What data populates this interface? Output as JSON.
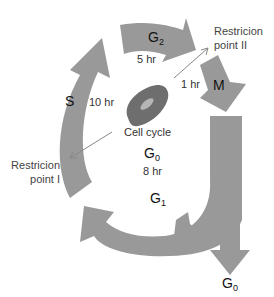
{
  "diagram": {
    "title": "Cell cycle",
    "colors": {
      "arrow": "#999999",
      "cell_outer": "#6e6e6e",
      "cell_inner": "#b5b5b5"
    },
    "phases": [
      {
        "id": "S",
        "label": "S",
        "duration": "10 hr"
      },
      {
        "id": "G2",
        "label": "G",
        "sub": "2",
        "duration": "5 hr"
      },
      {
        "id": "M",
        "label": "M",
        "duration": "1 hr"
      },
      {
        "id": "G1",
        "label": "G",
        "sub": "1",
        "duration": "8 hr"
      }
    ],
    "center_g0": {
      "label": "G",
      "sub": "0"
    },
    "exit_g0": {
      "label": "G",
      "sub": "0"
    },
    "restriction_points": [
      {
        "line1": "Restricion",
        "line2": "point II"
      },
      {
        "line1": "Restricion",
        "line2": "point I"
      }
    ]
  }
}
